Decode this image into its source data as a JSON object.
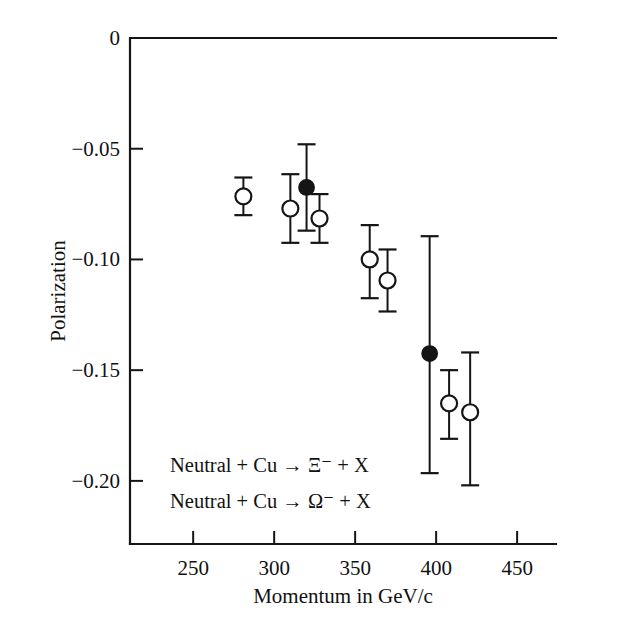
{
  "chart_data": {
    "type": "scatter",
    "title": "",
    "xlabel": "Momentum in GeV/c",
    "ylabel": "Polarization",
    "xlim": [
      211,
      474
    ],
    "ylim": [
      -0.2285,
      0.0
    ],
    "grid": false,
    "xticks": [
      250,
      300,
      350,
      400,
      450
    ],
    "xtick_labels": [
      "250",
      "300",
      "350",
      "400",
      "450"
    ],
    "yticks": [
      0,
      -0.05,
      -0.1,
      -0.15,
      -0.2
    ],
    "ytick_labels": [
      "0",
      "−0.05",
      "−0.10",
      "−0.15",
      "−0.20"
    ],
    "legend_position": "lower-left-inside",
    "annotations": [
      "Neutral + Cu → Ξ⁻ + X",
      "Neutral + Cu → Ω⁻ + X"
    ],
    "series": [
      {
        "name": "Neutral + Cu → Ξ⁻ + X",
        "marker": "open-circle",
        "points": [
          {
            "x": 281,
            "y": -0.0715,
            "yerr_low": 0.0085,
            "yerr_high": 0.0085
          },
          {
            "x": 310,
            "y": -0.077,
            "yerr_low": 0.0155,
            "yerr_high": 0.0155
          },
          {
            "x": 328,
            "y": -0.0815,
            "yerr_low": 0.011,
            "yerr_high": 0.011
          },
          {
            "x": 359,
            "y": -0.1,
            "yerr_low": 0.0175,
            "yerr_high": 0.0155
          },
          {
            "x": 370,
            "y": -0.1095,
            "yerr_low": 0.014,
            "yerr_high": 0.014
          },
          {
            "x": 408,
            "y": -0.165,
            "yerr_low": 0.016,
            "yerr_high": 0.015
          },
          {
            "x": 421,
            "y": -0.169,
            "yerr_low": 0.033,
            "yerr_high": 0.027
          }
        ]
      },
      {
        "name": "Neutral + Cu → Ω⁻ + X",
        "marker": "filled-circle",
        "points": [
          {
            "x": 320,
            "y": -0.0675,
            "yerr_low": 0.0195,
            "yerr_high": 0.0195
          },
          {
            "x": 396,
            "y": -0.1425,
            "yerr_low": 0.054,
            "yerr_high": 0.053
          }
        ]
      }
    ]
  },
  "axes": {
    "y_title": "Polarization",
    "x_title": "Momentum in GeV/c"
  },
  "legend": {
    "line1": "Neutral + Cu → Ξ⁻ + X",
    "line2": "Neutral + Cu → Ω⁻ + X"
  },
  "colors": {
    "ink": "#151515",
    "background": "#ffffff"
  }
}
